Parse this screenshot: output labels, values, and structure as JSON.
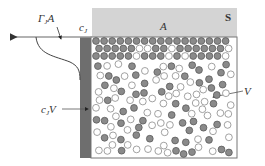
{
  "diagram": {
    "title": "",
    "colors": {
      "surface_band": "#d4d4d4",
      "boundary_layer": "#6e6e6e",
      "box_outline": "#777777",
      "particle_dark_fill": "#8a8a8a",
      "particle_dark_stroke": "#5c5c5c",
      "particle_light_fill": "#ffffff",
      "particle_light_stroke": "#8a8a8a",
      "axis_line": "#999999",
      "curve": "#444444"
    },
    "labels": {
      "flux": {
        "main": "Γ",
        "sub": "J",
        "tail": "A"
      },
      "surface_conc": {
        "main": "c",
        "sub": "J"
      },
      "volume_term": {
        "main": "c",
        "sub": "J",
        "tail": "V"
      },
      "volume": "V",
      "area": "A",
      "surface": "S"
    }
  }
}
